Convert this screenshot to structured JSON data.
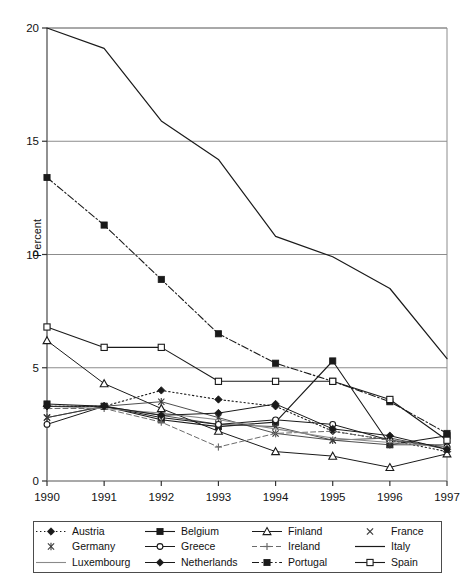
{
  "axis": {
    "ylabel": "Percent",
    "yticks": [
      0,
      5,
      10,
      15,
      20
    ],
    "ytick_labels": [
      "0",
      "5",
      "10",
      "15",
      "20"
    ],
    "xticks": [
      1990,
      1991,
      1992,
      1993,
      1994,
      1995,
      1996,
      1997
    ],
    "xtick_labels": [
      "1990",
      "1991",
      "1992",
      "1993",
      "1994",
      "1995",
      "1996",
      "1997"
    ]
  },
  "legend": {
    "entries": [
      {
        "label": "Austria",
        "marker": "diamond-filled",
        "line": "dotted",
        "order": 1
      },
      {
        "label": "Belgium",
        "marker": "square-filled",
        "line": "solid",
        "order": 2
      },
      {
        "label": "Finland",
        "marker": "triangle-open",
        "line": "solid",
        "order": 3
      },
      {
        "label": "France",
        "marker": "cross-x",
        "line": "none",
        "order": 4
      },
      {
        "label": "Germany",
        "marker": "asterisk",
        "line": "none",
        "order": 5
      },
      {
        "label": "Greece",
        "marker": "circle-open",
        "line": "solid",
        "order": 6
      },
      {
        "label": "Ireland",
        "marker": "plus",
        "line": "dashed",
        "order": 7
      },
      {
        "label": "Italy",
        "marker": "none",
        "line": "solid",
        "order": 8
      },
      {
        "label": "Luxembourg",
        "marker": "none",
        "line": "solid-gray",
        "order": 9
      },
      {
        "label": "Netherlands",
        "marker": "diamond-filled",
        "line": "solid",
        "order": 10
      },
      {
        "label": "Portugal",
        "marker": "square-filled",
        "line": "dashdot",
        "order": 11
      },
      {
        "label": "Spain",
        "marker": "square-open",
        "line": "solid",
        "order": 12
      }
    ]
  },
  "chart_data": {
    "type": "line",
    "title": "",
    "xlabel": "",
    "ylabel": "Percent",
    "x": [
      1990,
      1991,
      1992,
      1993,
      1994,
      1995,
      1996,
      1997
    ],
    "xlim": [
      1990,
      1997
    ],
    "ylim": [
      0,
      20
    ],
    "grid": true,
    "legend_position": "below",
    "series": [
      {
        "name": "Austria",
        "values": [
          3.3,
          3.3,
          4.0,
          3.6,
          3.3,
          2.2,
          1.8,
          1.3
        ]
      },
      {
        "name": "Belgium",
        "values": [
          3.4,
          3.3,
          2.7,
          2.4,
          2.6,
          5.3,
          1.6,
          2.0
        ]
      },
      {
        "name": "Finland",
        "values": [
          6.2,
          4.3,
          3.2,
          2.2,
          1.3,
          1.1,
          0.6,
          1.2
        ]
      },
      {
        "name": "France",
        "values": [
          2.8,
          3.3,
          2.9,
          2.5,
          2.4,
          1.8,
          1.9,
          1.4
        ]
      },
      {
        "name": "Germany",
        "values": [
          2.8,
          3.3,
          3.5,
          2.8,
          2.1,
          1.8,
          1.6,
          1.6
        ]
      },
      {
        "name": "Greece",
        "values": [
          2.5,
          3.3,
          2.8,
          2.5,
          2.7,
          2.5,
          1.8,
          1.5
        ]
      },
      {
        "name": "Ireland",
        "values": [
          3.2,
          3.2,
          2.6,
          1.5,
          2.1,
          2.2,
          1.8,
          1.5
        ]
      },
      {
        "name": "Italy",
        "values": [
          20.0,
          19.1,
          15.9,
          14.2,
          10.8,
          9.9,
          8.5,
          5.4
        ]
      },
      {
        "name": "Luxembourg",
        "values": [
          3.3,
          3.2,
          3.0,
          2.7,
          2.3,
          1.9,
          1.7,
          1.5
        ]
      },
      {
        "name": "Netherlands",
        "values": [
          3.3,
          3.3,
          2.9,
          3.0,
          3.4,
          2.3,
          2.0,
          1.4
        ]
      },
      {
        "name": "Portugal",
        "values": [
          13.4,
          11.3,
          8.9,
          6.5,
          5.2,
          4.4,
          3.5,
          2.1
        ]
      },
      {
        "name": "Spain",
        "values": [
          6.8,
          5.9,
          5.9,
          4.4,
          4.4,
          4.4,
          3.6,
          1.8
        ]
      }
    ]
  }
}
